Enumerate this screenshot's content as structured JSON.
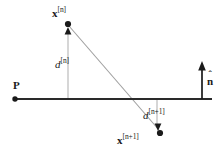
{
  "figure": {
    "type": "geometry-diagram",
    "background_color": "#ffffff",
    "ink_color": "#1a1a1a",
    "ray_color": "#9a9a9a",
    "guide_color": "#b0b0b0"
  },
  "labels": {
    "point_upper": {
      "symbol": "x",
      "superscript": "[n]"
    },
    "point_lower": {
      "symbol": "x",
      "superscript": "[n+1]"
    },
    "distance_upper": {
      "symbol": "d",
      "superscript": "[n]"
    },
    "distance_lower": {
      "symbol": "d",
      "superscript": "[n+1]"
    },
    "plane": {
      "symbol": "P"
    },
    "normal": {
      "symbol": "n",
      "accent": "ˆ"
    }
  },
  "geometry": {
    "plane_line": {
      "x1": 14,
      "y1": 99,
      "x2": 212,
      "y2": 99
    },
    "plane_dot": {
      "cx": 15,
      "cy": 99,
      "r": 2.6
    },
    "upper_point_dot": {
      "cx": 68,
      "cy": 24,
      "r": 3.0
    },
    "lower_point_dot": {
      "cx": 160,
      "cy": 133,
      "r": 3.0
    },
    "upper_guide": {
      "x1": 68,
      "y1": 30,
      "x2": 68,
      "y2": 99
    },
    "lower_guide": {
      "x1": 157,
      "y1": 99,
      "x2": 157,
      "y2": 128
    },
    "trajectory": {
      "x1": 68,
      "y1": 25,
      "x2": 160,
      "y2": 131
    },
    "normal_arrow": {
      "x": 202,
      "y_base": 99,
      "y_tip": 62
    },
    "upper_arrow_tip": {
      "x": 68,
      "y": 28,
      "direction": "up"
    },
    "lower_arrow_tip": {
      "x": 158,
      "y": 129,
      "direction": "down"
    },
    "crossing_point": {
      "x": 134,
      "y": 99
    }
  }
}
